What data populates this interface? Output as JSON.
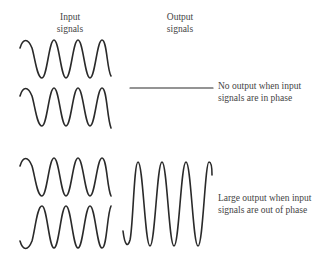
{
  "headers": {
    "input": [
      "Input",
      "signals"
    ],
    "output": [
      "Output",
      "signals"
    ]
  },
  "captions": {
    "in_phase": [
      "No output when input",
      "signals are in phase"
    ],
    "out_of_phase": [
      "Large output when input",
      "signals are out of phase"
    ]
  },
  "colors": {
    "stroke": "#2a2a2a",
    "text": "#444444",
    "background": "#ffffff"
  }
}
